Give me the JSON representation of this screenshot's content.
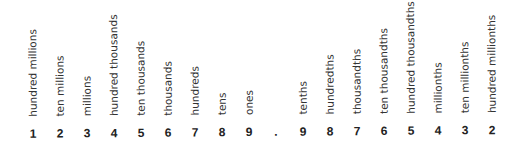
{
  "columns": [
    {
      "label": "hundred millions",
      "digit": "1"
    },
    {
      "label": "ten millions",
      "digit": "2"
    },
    {
      "label": "millions",
      "digit": "3"
    },
    {
      "label": "hundred thousands",
      "digit": "4"
    },
    {
      "label": "ten thousands",
      "digit": "5"
    },
    {
      "label": "thousands",
      "digit": "6"
    },
    {
      "label": "hundreds",
      "digit": "7"
    },
    {
      "label": "tens",
      "digit": "8"
    },
    {
      "label": "ones",
      "digit": "9"
    },
    {
      "label": "",
      "digit": "."
    },
    {
      "label": "tenths",
      "digit": "9"
    },
    {
      "label": "hundredths",
      "digit": "8"
    },
    {
      "label": "thousandths",
      "digit": "7"
    },
    {
      "label": "ten thousandths",
      "digit": "6"
    },
    {
      "label": "hundred thousandths",
      "digit": "5"
    },
    {
      "label": "millionths",
      "digit": "4"
    },
    {
      "label": "ten millionths",
      "digit": "3"
    },
    {
      "label": "hundred millionths",
      "digit": "2"
    }
  ],
  "number": "123456789.98765432"
}
